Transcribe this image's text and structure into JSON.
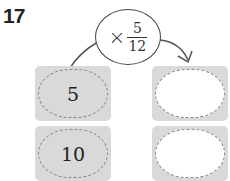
{
  "problem_number": "17",
  "operator": {
    "symbol": "×",
    "numerator": "5",
    "denominator": "12"
  },
  "inputs": [
    "5",
    "10"
  ],
  "outputs": [
    "",
    ""
  ],
  "colors": {
    "box_fill": "#d9d9d9",
    "dash": "#888888",
    "line": "#444444"
  }
}
